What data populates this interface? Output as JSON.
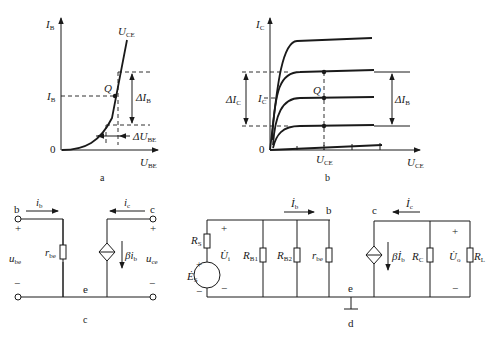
{
  "figures": {
    "a": {
      "caption": "a",
      "y_axis": {
        "main": "I",
        "sub": "B"
      },
      "x_axis": {
        "main": "U",
        "sub": "BE"
      },
      "origin": "0",
      "curve_label": {
        "main": "U",
        "sub": "CE"
      },
      "q_point": "Q",
      "ib_tick": {
        "main": "I",
        "sub": "B"
      },
      "delta_ib": {
        "main": "ΔI",
        "sub": "B"
      },
      "delta_ube": {
        "main": "ΔU",
        "sub": "BE"
      }
    },
    "b": {
      "caption": "b",
      "y_axis": {
        "main": "I",
        "sub": "C"
      },
      "x_axis": {
        "main": "U",
        "sub": "CE"
      },
      "origin": "0",
      "q_point": "Q",
      "ic_tick": {
        "main": "I",
        "sub": "C"
      },
      "uce_tick": {
        "main": "U",
        "sub": "CE"
      },
      "delta_ic": {
        "main": "ΔI",
        "sub": "C"
      },
      "delta_ib": {
        "main": "ΔI",
        "sub": "B"
      }
    },
    "c": {
      "caption": "c",
      "node_b": "b",
      "node_c": "c",
      "node_e": "e",
      "ib": {
        "main": "i",
        "sub": "b"
      },
      "ic": {
        "main": "i",
        "sub": "c"
      },
      "rbe": {
        "main": "r",
        "sub": "be"
      },
      "ube": {
        "main": "u",
        "sub": "be"
      },
      "uce": {
        "main": "u",
        "sub": "ce"
      },
      "source": {
        "main": "βi",
        "sub": "b"
      },
      "plus": "+",
      "minus": "−"
    },
    "d": {
      "caption": "d",
      "node_b": "b",
      "node_c": "c",
      "node_e": "e",
      "rs": {
        "main": "R",
        "sub": "S"
      },
      "es": {
        "main": "Ė",
        "sub": "S"
      },
      "ui": {
        "main": "U̇",
        "sub": "i"
      },
      "rb1": {
        "main": "R",
        "sub": "B1"
      },
      "rb2": {
        "main": "R",
        "sub": "B2"
      },
      "rbe": {
        "main": "r",
        "sub": "be"
      },
      "ib": {
        "main": "İ",
        "sub": "b"
      },
      "ic": {
        "main": "İ",
        "sub": "c"
      },
      "source": {
        "main": "βİ",
        "sub": "b"
      },
      "rc": {
        "main": "R",
        "sub": "C"
      },
      "uo": {
        "main": "U̇",
        "sub": "o"
      },
      "rl": {
        "main": "R",
        "sub": "L"
      },
      "plus": "+",
      "minus": "−"
    }
  }
}
